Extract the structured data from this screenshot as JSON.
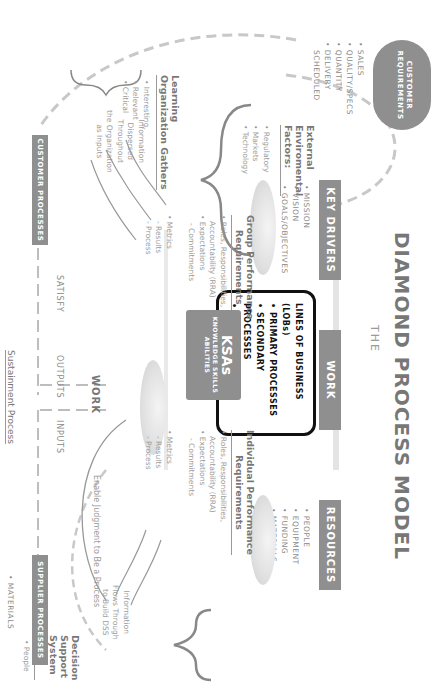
{
  "title": {
    "prefix": "THE",
    "main": "DIAMOND PROCESS MODEL"
  },
  "cloud": {
    "label_line1": "CUSTOMER",
    "label_line2": "REQUIREMENTS"
  },
  "customer_requirements": [
    "• SALES",
    "• QUALITY/SPECS",
    "• QUANTITY",
    "• DELIVERY",
    "  SCHEDULED"
  ],
  "key_drivers": {
    "header": "KEY DRIVERS",
    "items": [
      "• MISSION",
      "• VISION",
      "• GOALS/OBJECTIVES"
    ]
  },
  "work": {
    "header": "WORK",
    "lob_items": [
      "LINES OF BUSINESS (LOBs)",
      "• PRIMARY PROCESSES",
      "• SECONDARY PROCESSES",
      "• TASK/FUNCTION"
    ]
  },
  "resources": {
    "header": "RESOURCES",
    "items": [
      "• PEOPLE",
      "• EQUIPMENT",
      "• FUNDING",
      "• MATERIALS"
    ]
  },
  "external_factors": {
    "heading_lines": [
      "External",
      "Enviromental",
      "Factors:"
    ],
    "items": [
      "• Regulatory",
      "• Markets",
      "• Technology"
    ]
  },
  "group_performance": {
    "heading_lines": [
      "Group Performance",
      "Requirements"
    ],
    "items": [
      "• Roles, Responsibilities,",
      "  Accountability (RRA)",
      "• Expectations",
      "  - Commitments"
    ]
  },
  "group_metrics": [
    "• Metrics",
    "  - Results",
    "  - Process"
  ],
  "ksas": {
    "title": "KSAs",
    "line1": "KNOWLEDGE SKILLS",
    "line2": "ABILITIES"
  },
  "individual_performance": {
    "heading_lines": [
      "Individual Performance",
      "Requirements"
    ],
    "items": [
      "• Roles, Responsibilities,",
      "  Accountability (RRA)",
      "• Expectations",
      "  - Commitments"
    ]
  },
  "individual_metrics": [
    "• Metrics",
    "  - Results",
    "  - Process"
  ],
  "learning_org": {
    "heading_lines": [
      "Learning",
      "Organization Gathers"
    ],
    "items": [
      "• Interesting",
      "• Relevant",
      "• Critical"
    ],
    "info_lines": [
      "Information",
      "Dispersed",
      "Throughout",
      "the Organization",
      "as Inputs"
    ]
  },
  "dss_info": [
    "Information",
    "Flows Through",
    "to Build DSS"
  ],
  "dss": {
    "heading_lines": [
      "Decision",
      "Support",
      "System",
      "(DSS)"
    ],
    "items": [
      "• People",
      "• Strategic",
      "  Planning",
      "• Crisis"
    ]
  },
  "flow": {
    "customer_processes": "CUSTOMER PROCESSES",
    "supplier_processes": "SUPPLIER PROCESSES",
    "satisfy": "SATISFY",
    "outputs": "OUTPUTS",
    "inputs": "INPUTS",
    "work": "WORK",
    "enable": "Enable Judgment to Be a Process",
    "sustainment": "Sustainment Process",
    "materials": "• MATERIALS"
  }
}
